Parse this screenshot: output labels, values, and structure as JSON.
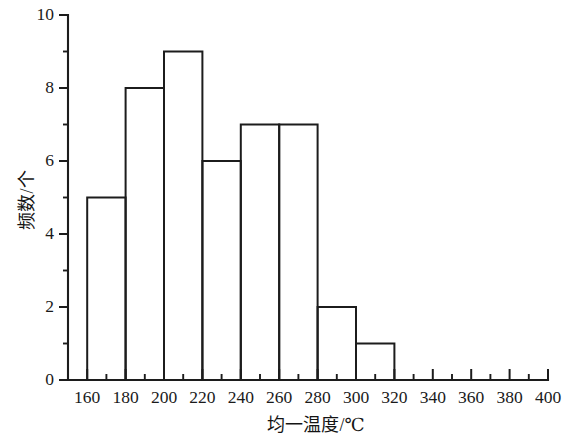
{
  "chart_data": {
    "type": "bar",
    "title": "",
    "subtitle": "",
    "xlabel": "均一温度/℃",
    "ylabel": "频数/个",
    "xlim": [
      150,
      400
    ],
    "ylim": [
      0,
      10
    ],
    "grid": false,
    "legend": false,
    "legend_position": "none",
    "bin_width": 20,
    "categories": [
      "160-180",
      "180-200",
      "200-220",
      "220-240",
      "240-260",
      "260-280",
      "280-300",
      "300-320"
    ],
    "bin_edges": [
      160,
      180,
      200,
      220,
      240,
      260,
      280,
      300,
      320
    ],
    "values": [
      5,
      8,
      9,
      6,
      7,
      7,
      2,
      1
    ],
    "bars": [
      {
        "start": 160,
        "end": 180,
        "value": 5
      },
      {
        "start": 180,
        "end": 200,
        "value": 8
      },
      {
        "start": 200,
        "end": 220,
        "value": 9
      },
      {
        "start": 220,
        "end": 240,
        "value": 6
      },
      {
        "start": 240,
        "end": 260,
        "value": 7
      },
      {
        "start": 260,
        "end": 280,
        "value": 7
      },
      {
        "start": 280,
        "end": 300,
        "value": 2
      },
      {
        "start": 300,
        "end": 320,
        "value": 1
      }
    ],
    "x_ticks": [
      160,
      180,
      200,
      220,
      240,
      260,
      280,
      300,
      320,
      340,
      360,
      380,
      400
    ],
    "x_tick_labels": [
      "160",
      "180",
      "200",
      "220",
      "240",
      "260",
      "280",
      "300",
      "320",
      "340",
      "360",
      "380",
      "400"
    ],
    "x_minor_ticks": [
      150,
      170,
      190,
      210,
      230,
      250,
      270,
      290,
      310,
      330,
      350,
      370,
      390
    ],
    "y_ticks": [
      0,
      2,
      4,
      6,
      8,
      10
    ],
    "y_tick_labels": [
      "0",
      "2",
      "4",
      "6",
      "8",
      "10"
    ],
    "y_minor_ticks": [
      1,
      3,
      5,
      7,
      9
    ],
    "total_frequency": 45,
    "colors": {
      "background": "#ffffff",
      "line": "#1c1c1c",
      "text": "#1a1a1a",
      "bar_fill": "none"
    }
  }
}
